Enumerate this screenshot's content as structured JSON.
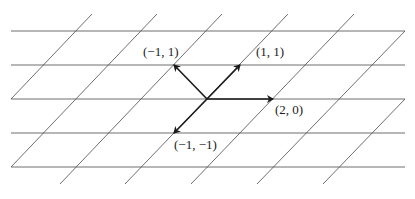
{
  "diagram": {
    "title": "",
    "colors": {
      "grid": "#4a4a4a",
      "vector": "#1a1a1a",
      "label": "#222222",
      "background": "#ffffff"
    },
    "grid": {
      "horizontal_lines": [
        {
          "x1": 11,
          "y1": 31,
          "x2": 405,
          "y2": 31
        },
        {
          "x1": 11,
          "y1": 65,
          "x2": 405,
          "y2": 65
        },
        {
          "x1": 11,
          "y1": 99,
          "x2": 405,
          "y2": 99
        },
        {
          "x1": 11,
          "y1": 133,
          "x2": 405,
          "y2": 133
        },
        {
          "x1": 11,
          "y1": 167,
          "x2": 405,
          "y2": 167
        }
      ],
      "diagonal_lines": [
        {
          "x1": 11,
          "y1": 99,
          "x2": 92,
          "y2": 14
        },
        {
          "x1": 11,
          "y1": 167,
          "x2": 157,
          "y2": 14
        },
        {
          "x1": 60,
          "y1": 184,
          "x2": 222,
          "y2": 14
        },
        {
          "x1": 125,
          "y1": 184,
          "x2": 288,
          "y2": 14
        },
        {
          "x1": 191,
          "y1": 184,
          "x2": 354,
          "y2": 14
        },
        {
          "x1": 257,
          "y1": 184,
          "x2": 405,
          "y2": 31
        },
        {
          "x1": 323,
          "y1": 184,
          "x2": 405,
          "y2": 99
        }
      ]
    },
    "origin": {
      "x": 207,
      "y": 99
    },
    "vectors": [
      {
        "name": "vector-2-0",
        "label": "(2, 0)",
        "x2": 273,
        "y2": 99,
        "label_x": 275,
        "label_y": 114
      },
      {
        "name": "vector-1-1",
        "label": "(1, 1)",
        "x2": 240,
        "y2": 65,
        "label_x": 256,
        "label_y": 56
      },
      {
        "name": "vector-neg1-1",
        "label": "(−1, 1)",
        "x2": 174,
        "y2": 65,
        "label_x": 143,
        "label_y": 56
      },
      {
        "name": "vector-neg1-neg1",
        "label": "(−1, −1)",
        "x2": 174,
        "y2": 133,
        "label_x": 174,
        "label_y": 149
      }
    ]
  }
}
